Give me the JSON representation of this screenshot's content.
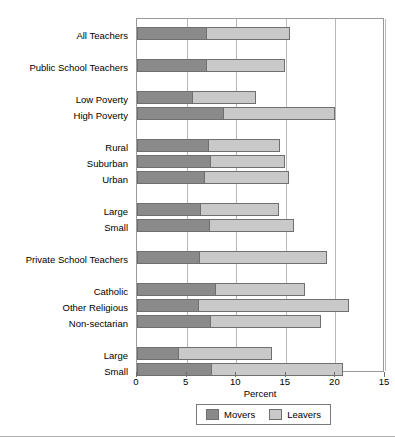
{
  "chart_data": {
    "type": "bar",
    "orientation": "horizontal",
    "stacked": true,
    "title": "",
    "xlabel": "Percent",
    "ylabel": "",
    "xlim": [
      0,
      25
    ],
    "xticks": [
      0,
      5,
      10,
      15,
      20,
      25
    ],
    "xticklabels": [
      "0",
      "5",
      "10",
      "15",
      "20",
      "15"
    ],
    "grid": true,
    "grid_axis": "x",
    "legend_position": "bottom-center",
    "categories": [
      "All Teachers",
      "Public School Teachers",
      "Low Poverty",
      "High Poverty",
      "Rural",
      "Suburban",
      "Urban",
      "Large",
      "Small",
      "Private School Teachers",
      "Catholic",
      "Other Religious",
      "Non-sectarian",
      "Large",
      "Small"
    ],
    "series": [
      {
        "name": "Movers",
        "color": "#8a8a8a",
        "values": [
          7.1,
          7.1,
          5.6,
          8.8,
          7.3,
          7.5,
          6.9,
          6.5,
          7.4,
          6.4,
          8.0,
          6.2,
          7.5,
          4.2,
          7.6
        ]
      },
      {
        "name": "Leavers",
        "color": "#c9c9c9",
        "values": [
          8.3,
          7.8,
          6.4,
          11.2,
          7.1,
          7.4,
          8.4,
          7.8,
          8.4,
          12.8,
          8.9,
          15.2,
          11.0,
          9.4,
          13.2
        ]
      }
    ],
    "totals": [
      15.4,
      14.9,
      12.0,
      20.0,
      14.4,
      14.9,
      15.3,
      14.3,
      15.8,
      19.2,
      16.9,
      21.4,
      18.5,
      13.6,
      20.8
    ],
    "groups": [
      {
        "label": "",
        "members": [
          "All Teachers"
        ]
      },
      {
        "label": "",
        "members": [
          "Public School Teachers"
        ]
      },
      {
        "label": "",
        "members": [
          "Low Poverty",
          "High Poverty"
        ]
      },
      {
        "label": "",
        "members": [
          "Rural",
          "Suburban",
          "Urban"
        ]
      },
      {
        "label": "",
        "members": [
          "Large",
          "Small"
        ]
      },
      {
        "label": "",
        "members": [
          "Private School Teachers"
        ]
      },
      {
        "label": "",
        "members": [
          "Catholic",
          "Other Religious",
          "Non-sectarian"
        ]
      },
      {
        "label": "",
        "members": [
          "Large",
          "Small"
        ]
      }
    ]
  },
  "legend": {
    "items": [
      {
        "label": "Movers",
        "color": "#8a8a8a"
      },
      {
        "label": "Leavers",
        "color": "#c9c9c9"
      }
    ]
  },
  "axis": {
    "x_title": "Percent"
  },
  "colors": {
    "movers": "#8a8a8a",
    "leavers": "#c9c9c9",
    "grid": "#b8b8b8",
    "frame": "#9a9a9a",
    "text": "#000000",
    "background": "#ffffff"
  }
}
